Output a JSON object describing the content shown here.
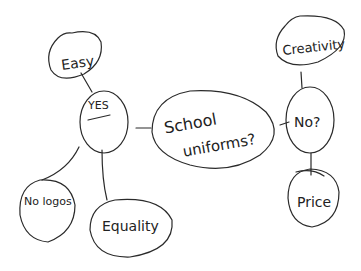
{
  "diagram": {
    "type": "mind-map",
    "style": "hand-drawn",
    "background": "#ffffff",
    "ink_color": "#2a2a2a",
    "center": {
      "label_line1": "School",
      "label_line2": "uniforms?"
    },
    "branches": {
      "yes": {
        "label": "YES",
        "children": [
          "Easy",
          "No logos",
          "Equality"
        ]
      },
      "no": {
        "label": "No?",
        "children": [
          "Creativity",
          "Price"
        ]
      }
    }
  }
}
